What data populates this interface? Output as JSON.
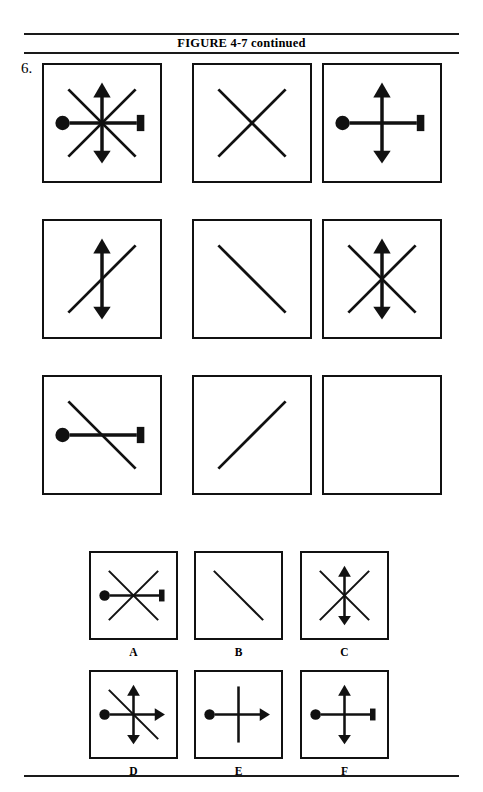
{
  "page": {
    "width": 483,
    "height": 792,
    "background_color": "#ffffff",
    "ink_color": "#111111"
  },
  "header": {
    "title": "FIGURE 4-7 continued",
    "rule_color": "#1a1a1a"
  },
  "item": {
    "number_label": "6."
  },
  "matrix": {
    "rows": 3,
    "cols": 3,
    "box_size": 120,
    "cells": [
      {
        "id": "matrix-cell-r1c1",
        "row": 1,
        "col": 1,
        "x": 42,
        "y": 63,
        "elements": [
          "horizontal-circle-bar",
          "vertical-double-arrow",
          "diagonal-slash",
          "diagonal-backslash"
        ],
        "description": "circle-left and bar-right horizontal, up and down arrows vertical, both diagonals"
      },
      {
        "id": "matrix-cell-r1c2",
        "row": 1,
        "col": 2,
        "x": 192,
        "y": 63,
        "elements": [
          "diagonal-slash",
          "diagonal-backslash"
        ],
        "description": "both diagonals forming an X"
      },
      {
        "id": "matrix-cell-r1c3",
        "row": 1,
        "col": 3,
        "x": 322,
        "y": 63,
        "elements": [
          "horizontal-circle-bar",
          "vertical-double-arrow"
        ],
        "description": "circle-left and bar-right horizontal, up and down arrows vertical"
      },
      {
        "id": "matrix-cell-r2c1",
        "row": 2,
        "col": 1,
        "x": 42,
        "y": 219,
        "elements": [
          "vertical-double-arrow",
          "diagonal-slash"
        ],
        "description": "vertical double arrow plus forward diagonal"
      },
      {
        "id": "matrix-cell-r2c2",
        "row": 2,
        "col": 2,
        "x": 192,
        "y": 219,
        "elements": [
          "diagonal-backslash"
        ],
        "description": "single backslash diagonal"
      },
      {
        "id": "matrix-cell-r2c3",
        "row": 2,
        "col": 3,
        "x": 322,
        "y": 219,
        "elements": [
          "vertical-double-arrow",
          "diagonal-slash",
          "diagonal-backslash"
        ],
        "description": "vertical double arrow plus both diagonals"
      },
      {
        "id": "matrix-cell-r3c1",
        "row": 3,
        "col": 1,
        "x": 42,
        "y": 375,
        "elements": [
          "horizontal-circle-bar",
          "diagonal-backslash"
        ],
        "description": "circle-left and bar-right horizontal plus backslash diagonal"
      },
      {
        "id": "matrix-cell-r3c2",
        "row": 3,
        "col": 2,
        "x": 192,
        "y": 375,
        "elements": [
          "diagonal-slash"
        ],
        "description": "single forward slash diagonal"
      },
      {
        "id": "matrix-cell-r3c3",
        "row": 3,
        "col": 3,
        "x": 322,
        "y": 375,
        "elements": [],
        "description": "empty answer cell"
      }
    ]
  },
  "options": {
    "box_size": 89,
    "items": [
      {
        "id": "option-a",
        "label": "A",
        "x": 89,
        "y": 551,
        "elements": [
          "horizontal-circle-bar",
          "diagonal-slash",
          "diagonal-backslash"
        ],
        "description": "circle-left and bar-right horizontal plus both diagonals"
      },
      {
        "id": "option-b",
        "label": "B",
        "x": 194,
        "y": 551,
        "elements": [
          "diagonal-backslash"
        ],
        "description": "single backslash diagonal"
      },
      {
        "id": "option-c",
        "label": "C",
        "x": 300,
        "y": 551,
        "elements": [
          "vertical-double-arrow",
          "diagonal-slash",
          "diagonal-backslash"
        ],
        "description": "vertical double arrow plus both diagonals"
      },
      {
        "id": "option-d",
        "label": "D",
        "x": 89,
        "y": 670,
        "elements": [
          "horizontal-circle-rightarrow",
          "vertical-double-arrow",
          "diagonal-backslash"
        ],
        "description": "circle-left and right arrow horizontal, vertical double arrow, backslash diagonal"
      },
      {
        "id": "option-e",
        "label": "E",
        "x": 194,
        "y": 670,
        "elements": [
          "horizontal-circle-rightarrow",
          "vertical-plain"
        ],
        "description": "circle-left and right arrow horizontal plus plain vertical line"
      },
      {
        "id": "option-f",
        "label": "F",
        "x": 300,
        "y": 670,
        "elements": [
          "horizontal-circle-bar",
          "vertical-double-arrow"
        ],
        "description": "circle-left and bar-right horizontal plus vertical double arrow"
      }
    ]
  }
}
